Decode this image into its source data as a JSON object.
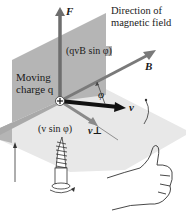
{
  "diagram": {
    "title_label": "Direction of magnetic field",
    "title_line1": "Direction of",
    "title_line2": "magnetic field",
    "force_label": "F",
    "force_magnitude": "(qvB sin φ)",
    "field_label": "B",
    "charge_label_line1": "Moving",
    "charge_label_line2": "charge q",
    "charge_symbol": "+",
    "angle_label": "φ",
    "velocity_label": "v",
    "v_perp_label": "v⊥",
    "v_perp_magnitude": "(v sin φ)",
    "illustrations": [
      "right-hand-screw",
      "right-hand-thumb-up"
    ]
  },
  "colors": {
    "vertical_plane": "#b3b3b3",
    "horizontal_plane": "#e6e6e6",
    "force_arrow": "#6e6e6e",
    "field_arrow": "#7a7a7a",
    "velocity_arrow": "#111111",
    "v_perp_arrow": "#8a8a8a",
    "text": "#1a1a1a"
  }
}
